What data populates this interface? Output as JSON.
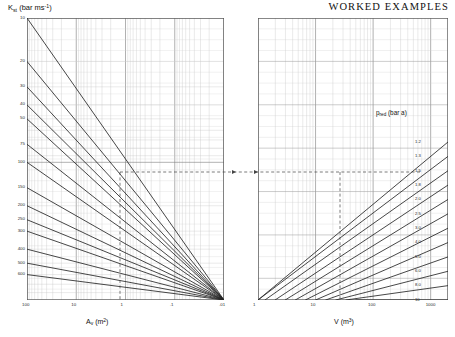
{
  "header": {
    "title": "WORKED EXAMPLES"
  },
  "chart_data": [
    {
      "id": "left",
      "type": "line",
      "title": "",
      "xlabel": "A_v (m2)",
      "ylabel": "K_st (bar ms-1)",
      "xlabel_base": "A",
      "xlabel_sub": "v",
      "xlabel_unit": "(m",
      "xlabel_sup": "2",
      "xlabel_close": ")",
      "ylabel_base": "K",
      "ylabel_sub": "st",
      "ylabel_unit": "(bar ms",
      "ylabel_sup": "-1",
      "ylabel_close": ")",
      "xscale": "log",
      "yscale": "log",
      "x_reversed": true,
      "y_reversed": true,
      "xlim": [
        100,
        0.01
      ],
      "ylim": [
        10,
        900
      ],
      "grid": true,
      "xticks": [
        "100",
        "10",
        "1",
        ".1",
        ".01"
      ],
      "xtick_values": [
        100,
        10,
        1,
        0.1,
        0.01
      ],
      "yticks": [
        "10",
        "20",
        "30",
        "40",
        "50",
        "75",
        "100",
        "150",
        "200",
        "250",
        "300",
        "400",
        "500",
        "600"
      ],
      "ytick_values": [
        10,
        20,
        30,
        40,
        50,
        75,
        100,
        150,
        200,
        250,
        300,
        400,
        500,
        600
      ],
      "series_note": "family of parallel descending straight lines, one per K_st value",
      "series": [
        {
          "name": "10",
          "y_at_left": 10
        },
        {
          "name": "20",
          "y_at_left": 20
        },
        {
          "name": "30",
          "y_at_left": 30
        },
        {
          "name": "40",
          "y_at_left": 40
        },
        {
          "name": "50",
          "y_at_left": 50
        },
        {
          "name": "75",
          "y_at_left": 75
        },
        {
          "name": "100",
          "y_at_left": 100
        },
        {
          "name": "150",
          "y_at_left": 150
        },
        {
          "name": "200",
          "y_at_left": 200
        },
        {
          "name": "250",
          "y_at_left": 250
        },
        {
          "name": "300",
          "y_at_left": 300
        },
        {
          "name": "400",
          "y_at_left": 400
        },
        {
          "name": "500",
          "y_at_left": 500
        },
        {
          "name": "600",
          "y_at_left": 600
        }
      ]
    },
    {
      "id": "right",
      "type": "line",
      "title": "",
      "xlabel": "V (m3)",
      "xlabel_base": "V",
      "xlabel_unit": "(m",
      "xlabel_sup": "3",
      "xlabel_close": ")",
      "ylabel": "",
      "xscale": "log",
      "yscale": "log",
      "xlim": [
        1,
        2000
      ],
      "grid": true,
      "xticks": [
        "1",
        "10",
        "100",
        "1000"
      ],
      "xtick_values": [
        1,
        10,
        100,
        1000
      ],
      "family_label_base": "p",
      "family_label_sub": "red",
      "family_label_unit": "(bar a)",
      "family_label": "p_red (bar a)",
      "series_note": "family of parallel ascending straight lines, one per reduced explosion pressure",
      "series": [
        {
          "name": "1.2"
        },
        {
          "name": "1.3"
        },
        {
          "name": "1.5"
        },
        {
          "name": "1.8"
        },
        {
          "name": "2.0"
        },
        {
          "name": "2.5"
        },
        {
          "name": "3.0"
        },
        {
          "name": "4.0"
        },
        {
          "name": "5.0"
        },
        {
          "name": "6.0"
        },
        {
          "name": "8.0"
        },
        {
          "name": "10"
        }
      ]
    }
  ],
  "construction": {
    "note": "dashed construction lines linking the two nomograph halves",
    "horizontal_label": "horizontal transfer line",
    "left_vertical_label": "A_v read-off",
    "right_vertical_label": "V read-off"
  }
}
